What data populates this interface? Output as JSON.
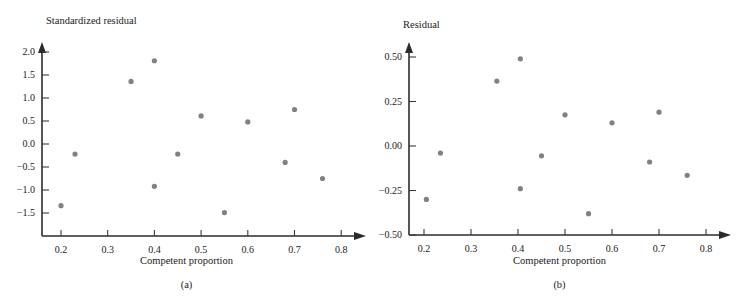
{
  "figure": {
    "panels": [
      {
        "id": "a",
        "caption": "(a)",
        "y_axis_title": "Standardized residual",
        "x_axis_title": "Competent proportion"
      },
      {
        "id": "b",
        "caption": "(b)",
        "y_axis_title": "Residual",
        "x_axis_title": "Competent proportion"
      }
    ],
    "point_color": "#808184",
    "axis_color": "#2b2b2b"
  },
  "chart_data": [
    {
      "type": "scatter",
      "panel": "(a)",
      "title": "",
      "xlabel": "Competent proportion",
      "ylabel": "Standardized residual",
      "xlim": [
        0.155,
        0.845
      ],
      "ylim": [
        -1.65,
        2.2
      ],
      "grid": false,
      "legend": null,
      "xticks": [
        0.2,
        0.3,
        0.4,
        0.5,
        0.6,
        0.7,
        0.8
      ],
      "xtick_labels": [
        "0.2",
        "0.3",
        "0.4",
        "0.5",
        "0.6",
        "0.7",
        "0.8"
      ],
      "yticks": [
        2.0,
        1.5,
        1.0,
        0.5,
        0.0,
        -0.5,
        -1.0,
        -1.5
      ],
      "ytick_labels": [
        "2.0",
        "1.5",
        "1.0",
        "0.5",
        "0.0",
        "−0.5",
        "−1.0",
        "−1.5"
      ],
      "x": [
        0.2,
        0.23,
        0.35,
        0.4,
        0.4,
        0.45,
        0.45,
        0.5,
        0.55,
        0.6,
        0.68,
        0.7,
        0.76
      ],
      "y": [
        -1.34,
        -0.22,
        1.36,
        1.81,
        -0.92,
        -0.22,
        -0.22,
        0.61,
        -1.49,
        0.48,
        -0.4,
        0.75,
        -0.75
      ],
      "points": [
        {
          "x": 0.2,
          "y": -1.34
        },
        {
          "x": 0.23,
          "y": -0.22
        },
        {
          "x": 0.35,
          "y": 1.36
        },
        {
          "x": 0.4,
          "y": 1.81
        },
        {
          "x": 0.4,
          "y": -0.92
        },
        {
          "x": 0.45,
          "y": -0.22
        },
        {
          "x": 0.5,
          "y": 0.61
        },
        {
          "x": 0.55,
          "y": -1.49
        },
        {
          "x": 0.6,
          "y": 0.48
        },
        {
          "x": 0.68,
          "y": -0.4
        },
        {
          "x": 0.7,
          "y": 0.75
        },
        {
          "x": 0.76,
          "y": -0.75
        }
      ]
    },
    {
      "type": "scatter",
      "panel": "(b)",
      "title": "",
      "xlabel": "Competent proportion",
      "ylabel": "Residual",
      "xlim": [
        0.155,
        0.845
      ],
      "ylim": [
        -0.5,
        0.575
      ],
      "grid": false,
      "legend": null,
      "xticks": [
        0.2,
        0.3,
        0.4,
        0.5,
        0.6,
        0.7,
        0.8
      ],
      "xtick_labels": [
        "0.2",
        "0.3",
        "0.4",
        "0.5",
        "0.6",
        "0.7",
        "0.8"
      ],
      "yticks": [
        0.5,
        0.25,
        0.0,
        -0.25,
        -0.5
      ],
      "ytick_labels": [
        "0.50",
        "0.25",
        "0.00",
        "−0.25",
        "−0.50"
      ],
      "x": [
        0.205,
        0.235,
        0.355,
        0.405,
        0.405,
        0.45,
        0.5,
        0.55,
        0.6,
        0.68,
        0.7,
        0.76
      ],
      "y": [
        -0.3,
        -0.04,
        0.365,
        0.49,
        -0.24,
        -0.055,
        0.175,
        -0.38,
        0.13,
        -0.09,
        0.19,
        -0.165
      ],
      "points": [
        {
          "x": 0.205,
          "y": -0.3
        },
        {
          "x": 0.235,
          "y": -0.04
        },
        {
          "x": 0.355,
          "y": 0.365
        },
        {
          "x": 0.405,
          "y": 0.49
        },
        {
          "x": 0.405,
          "y": -0.24
        },
        {
          "x": 0.45,
          "y": -0.055
        },
        {
          "x": 0.5,
          "y": 0.175
        },
        {
          "x": 0.55,
          "y": -0.38
        },
        {
          "x": 0.6,
          "y": 0.13
        },
        {
          "x": 0.68,
          "y": -0.09
        },
        {
          "x": 0.7,
          "y": 0.19
        },
        {
          "x": 0.76,
          "y": -0.165
        }
      ]
    }
  ]
}
